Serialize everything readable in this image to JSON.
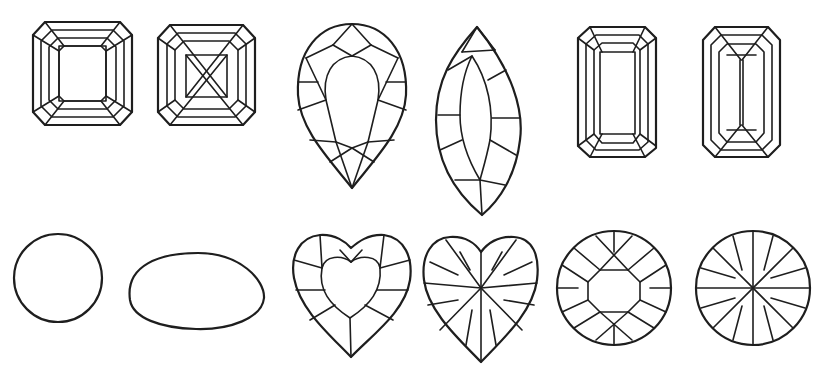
{
  "figure": {
    "title": "",
    "stroke_color": "#1e1e1e",
    "background": "#ffffff"
  },
  "gems": [
    {
      "name": "square-step-cut",
      "row": 1,
      "col": 1
    },
    {
      "name": "square-step-cut-crossed",
      "row": 1,
      "col": 2
    },
    {
      "name": "pear-brilliant-cut",
      "row": 1,
      "col": 3
    },
    {
      "name": "marquise-brilliant-cut",
      "row": 1,
      "col": 4
    },
    {
      "name": "emerald-step-cut",
      "row": 1,
      "col": 5
    },
    {
      "name": "emerald-step-cut-keel",
      "row": 1,
      "col": 6
    },
    {
      "name": "round-cabochon",
      "row": 2,
      "col": 1
    },
    {
      "name": "oval-cabochon",
      "row": 2,
      "col": 2
    },
    {
      "name": "heart-brilliant-cut-table",
      "row": 2,
      "col": 3
    },
    {
      "name": "heart-star-cut",
      "row": 2,
      "col": 4
    },
    {
      "name": "round-brilliant-cut-table",
      "row": 2,
      "col": 5
    },
    {
      "name": "round-star-cut",
      "row": 2,
      "col": 6
    }
  ]
}
